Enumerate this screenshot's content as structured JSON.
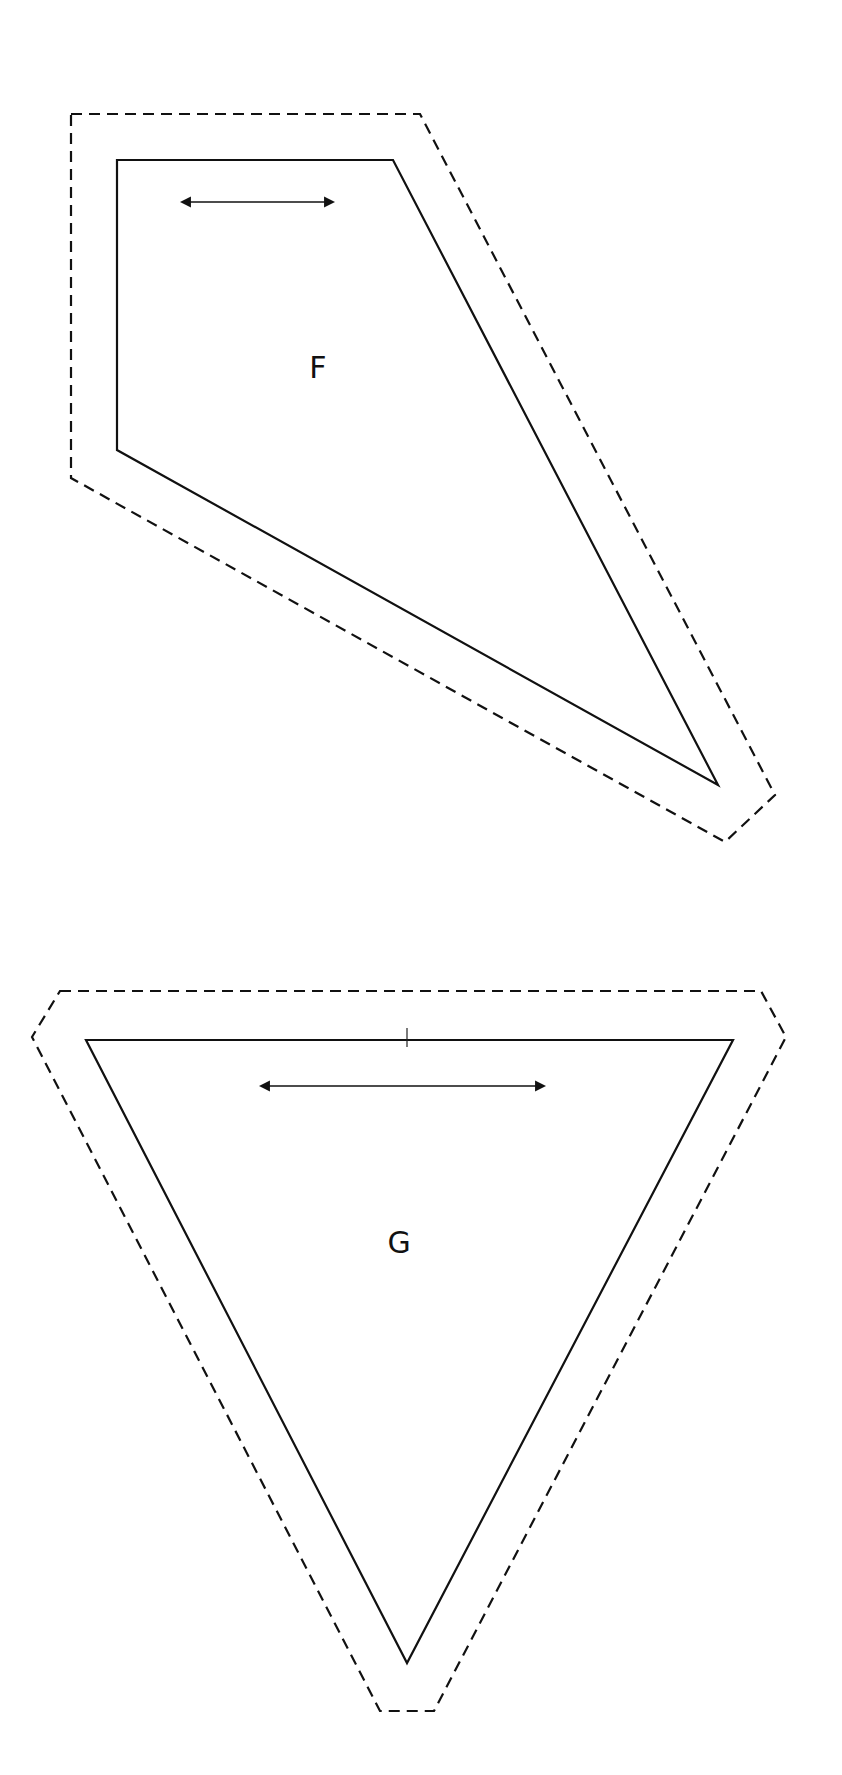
{
  "diagram": {
    "type": "sewing-pattern-pieces",
    "colors": {
      "background": "#ffffff",
      "line": "#111111"
    },
    "legend_styles": {
      "cut_line": "dashed",
      "seam_line": "solid",
      "grainline": "double-headed-arrow"
    },
    "pieces": [
      {
        "id": "F",
        "label": "F",
        "label_position": [
          318,
          368
        ],
        "seam_polygon": [
          [
            117,
            160
          ],
          [
            393,
            160
          ],
          [
            718,
            785
          ],
          [
            117,
            450
          ]
        ],
        "cut_polygon": [
          [
            71,
            114
          ],
          [
            420,
            114
          ],
          [
            775,
            795
          ],
          [
            725,
            842
          ],
          [
            71,
            478
          ]
        ],
        "grainline": {
          "from": [
            182,
            202
          ],
          "to": [
            333,
            202
          ]
        }
      },
      {
        "id": "G",
        "label": "G",
        "label_position": [
          399,
          1243
        ],
        "seam_polygon": [
          [
            86,
            1040
          ],
          [
            733,
            1040
          ],
          [
            407,
            1663
          ]
        ],
        "cut_polygon": [
          [
            60,
            991
          ],
          [
            761,
            991
          ],
          [
            786,
            1037
          ],
          [
            434,
            1711
          ],
          [
            380,
            1711
          ],
          [
            32,
            1037
          ]
        ],
        "grainline": {
          "from": [
            261,
            1086
          ],
          "to": [
            544,
            1086
          ]
        },
        "notch": {
          "x": 407,
          "y1": 1028,
          "y2": 1047
        }
      }
    ]
  }
}
